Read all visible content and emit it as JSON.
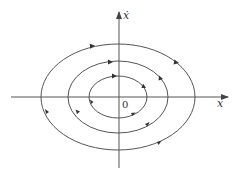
{
  "diagram": {
    "type": "phase-portrait",
    "axes": {
      "x_label": "x",
      "y_label": "ẋ",
      "origin_label": "0"
    },
    "colors": {
      "stroke": "#555555",
      "background": "#ffffff"
    },
    "center": {
      "cx": 118,
      "cy": 97
    },
    "trajectories": [
      {
        "name": "inner",
        "rx": 29,
        "ry": 21,
        "direction": "clockwise"
      },
      {
        "name": "middle",
        "rx": 50,
        "ry": 36,
        "direction": "clockwise"
      },
      {
        "name": "outer",
        "rx": 77,
        "ry": 53,
        "direction": "clockwise"
      }
    ]
  }
}
